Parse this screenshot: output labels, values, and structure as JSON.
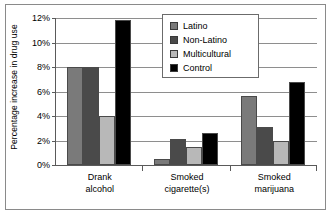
{
  "chart_data": {
    "type": "bar",
    "title": "",
    "xlabel": "",
    "ylabel": "Percentage increase in drug use",
    "categories": [
      "Drank alcohol",
      "Smoked cigarette(s)",
      "Smoked marijuana"
    ],
    "category_lines": [
      [
        "Drank",
        "alcohol"
      ],
      [
        "Smoked",
        "cigarette(s)"
      ],
      [
        "Smoked",
        "marijuana"
      ]
    ],
    "ylim": [
      0,
      12
    ],
    "ytick_values": [
      0,
      2,
      4,
      6,
      8,
      10,
      12
    ],
    "ytick_labels": [
      "0%",
      "2%",
      "4%",
      "6%",
      "8%",
      "10%",
      "12%"
    ],
    "grid": true,
    "legend_position": "top-center",
    "series": [
      {
        "name": "Latino",
        "color": "#7a7a7a",
        "values": [
          8.0,
          0.5,
          5.6
        ]
      },
      {
        "name": "Non-Latino",
        "color": "#4a4a4a",
        "values": [
          8.0,
          2.1,
          3.1
        ]
      },
      {
        "name": "Multicultural",
        "color": "#b8b8b8",
        "values": [
          4.0,
          1.5,
          2.0
        ]
      },
      {
        "name": "Control",
        "color": "#000000",
        "values": [
          11.8,
          2.6,
          6.8
        ]
      }
    ]
  },
  "legend": {
    "items": [
      {
        "label": "Latino"
      },
      {
        "label": "Non-Latino"
      },
      {
        "label": "Multicultural"
      },
      {
        "label": "Control"
      }
    ]
  }
}
